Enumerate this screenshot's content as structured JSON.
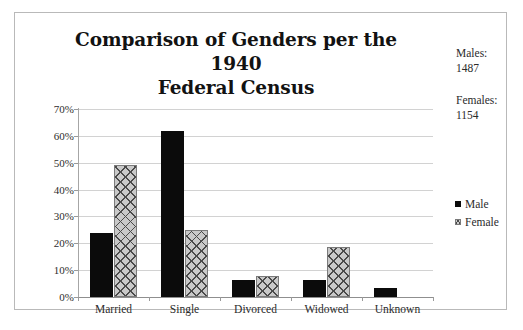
{
  "chart_data": {
    "type": "bar",
    "title_line1": "Comparison of Genders per the 1940",
    "title_line2": "Federal Census",
    "xlabel": "",
    "ylabel": "",
    "categories": [
      "Married",
      "Single",
      "Divorced",
      "Widowed",
      "Unknown"
    ],
    "series": [
      {
        "name": "Male",
        "values": [
          24,
          62,
          6.5,
          6.5,
          3.5
        ]
      },
      {
        "name": "Female",
        "values": [
          49,
          25,
          8,
          18.5,
          0
        ]
      }
    ],
    "ylim": [
      0,
      70
    ],
    "ytick_values": [
      70,
      60,
      50,
      40,
      30,
      20,
      10,
      0
    ],
    "ytick_labels": [
      "70%",
      "60%",
      "50%",
      "40%",
      "30%",
      "20%",
      "10%",
      "0%"
    ],
    "ytick_format": "percent",
    "grid": true,
    "grid_axis": "y",
    "legend_position": "right",
    "legend_entries": [
      "Male",
      "Female"
    ],
    "colors": {
      "male": "#0b0b0b",
      "female_fill": "#c9c9c9",
      "female_hatch": "#4a4a4a",
      "gridline": "#d2d2d2",
      "axis": "#9a9a9a",
      "border": "#b9b9b9",
      "text": "#2b2b2b",
      "title": "#121212",
      "background": "#ffffff"
    }
  },
  "annotations": {
    "males_label": "Males:",
    "males_value": "1487",
    "females_label": "Females:",
    "females_value": "1154",
    "males_text": "Males:\n1487",
    "females_text": "Females:\n1154"
  },
  "legend": {
    "items": [
      {
        "label": "Male",
        "swatch": "solid-black-square"
      },
      {
        "label": "Female",
        "swatch": "crosshatch-gray-square"
      }
    ]
  }
}
